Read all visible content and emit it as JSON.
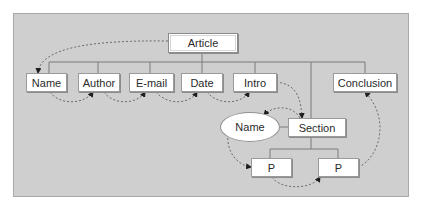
{
  "diagram": {
    "type": "document-structure-tree",
    "root": {
      "id": "article",
      "label": "Article"
    },
    "children_of_root": [
      {
        "id": "name",
        "label": "Name"
      },
      {
        "id": "author",
        "label": "Author"
      },
      {
        "id": "email",
        "label": "E-mail"
      },
      {
        "id": "date",
        "label": "Date"
      },
      {
        "id": "intro",
        "label": "Intro"
      },
      {
        "id": "section",
        "label": "Section"
      },
      {
        "id": "conclusion",
        "label": "Conclusion"
      }
    ],
    "section_children": [
      {
        "id": "section-name",
        "label": "Name",
        "shape": "ellipse"
      },
      {
        "id": "p1",
        "label": "P"
      },
      {
        "id": "p2",
        "label": "P"
      }
    ],
    "sequence_arrows": [
      [
        "article",
        "name"
      ],
      [
        "name",
        "author"
      ],
      [
        "author",
        "email"
      ],
      [
        "email",
        "date"
      ],
      [
        "date",
        "intro"
      ],
      [
        "intro",
        "section"
      ],
      [
        "section",
        "section-name"
      ],
      [
        "section-name",
        "p1"
      ],
      [
        "p1",
        "p2"
      ],
      [
        "p2",
        "conclusion"
      ]
    ],
    "colors": {
      "panel": "#cfcfcf",
      "panel_border": "#a9a9a9",
      "node_fill": "#ffffff",
      "tree_line": "#7a7a7a",
      "dashed_arrow": "#6a6a6a"
    }
  }
}
